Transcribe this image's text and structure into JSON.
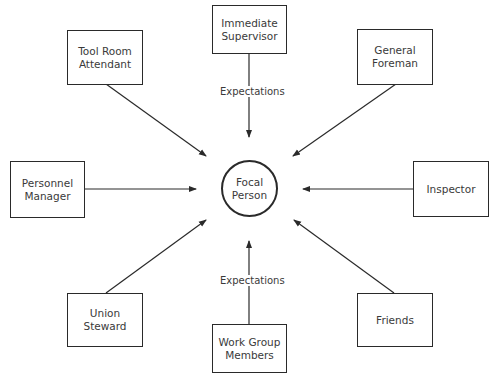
{
  "diagram": {
    "center": {
      "label_line1": "Focal",
      "label_line2": "Person"
    },
    "nodes": {
      "immediate_supervisor": {
        "line1": "Immediate",
        "line2": "Supervisor"
      },
      "tool_room_attendant": {
        "line1": "Tool Room",
        "line2": "Attendant"
      },
      "general_foreman": {
        "line1": "General",
        "line2": "Foreman"
      },
      "personnel_manager": {
        "line1": "Personnel",
        "line2": "Manager"
      },
      "inspector": {
        "line1": "Inspector"
      },
      "union_steward": {
        "line1": "Union",
        "line2": "Steward"
      },
      "work_group_members": {
        "line1": "Work Group",
        "line2": "Members"
      },
      "friends": {
        "line1": "Friends"
      }
    },
    "edge_labels": {
      "top": "Expectations",
      "bottom": "Expectations"
    },
    "edges": [
      {
        "from": "Immediate Supervisor",
        "to": "Focal Person",
        "label": "Expectations"
      },
      {
        "from": "Tool Room Attendant",
        "to": "Focal Person"
      },
      {
        "from": "General Foreman",
        "to": "Focal Person"
      },
      {
        "from": "Personnel Manager",
        "to": "Focal Person"
      },
      {
        "from": "Inspector",
        "to": "Focal Person"
      },
      {
        "from": "Union Steward",
        "to": "Focal Person"
      },
      {
        "from": "Work Group Members",
        "to": "Focal Person",
        "label": "Expectations"
      },
      {
        "from": "Friends",
        "to": "Focal Person"
      }
    ],
    "colors": {
      "stroke": "#2a2a2a",
      "text": "#3a3a3a",
      "background": "#ffffff"
    }
  }
}
